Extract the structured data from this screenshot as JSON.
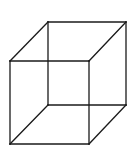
{
  "diagram": {
    "type": "necker-cube-wireframe",
    "stroke_color": "#1a1a1a",
    "background": "#ffffff",
    "vertices": {
      "front_top_left": [
        10,
        61
      ],
      "front_top_right": [
        89,
        61
      ],
      "front_bottom_left": [
        10,
        144
      ],
      "front_bottom_right": [
        89,
        144
      ],
      "back_top_left": [
        48,
        22
      ],
      "back_top_right": [
        126,
        22
      ],
      "back_bottom_left": [
        48,
        105
      ],
      "back_bottom_right": [
        126,
        105
      ]
    },
    "edges": [
      [
        "front_top_left",
        "front_top_right"
      ],
      [
        "front_top_right",
        "front_bottom_right"
      ],
      [
        "front_bottom_right",
        "front_bottom_left"
      ],
      [
        "front_bottom_left",
        "front_top_left"
      ],
      [
        "back_top_left",
        "back_top_right"
      ],
      [
        "back_top_right",
        "back_bottom_right"
      ],
      [
        "back_bottom_right",
        "back_bottom_left"
      ],
      [
        "back_bottom_left",
        "back_top_left"
      ],
      [
        "front_top_left",
        "back_top_left"
      ],
      [
        "front_top_right",
        "back_top_right"
      ],
      [
        "front_bottom_left",
        "back_bottom_left"
      ],
      [
        "front_bottom_right",
        "back_bottom_right"
      ]
    ]
  }
}
